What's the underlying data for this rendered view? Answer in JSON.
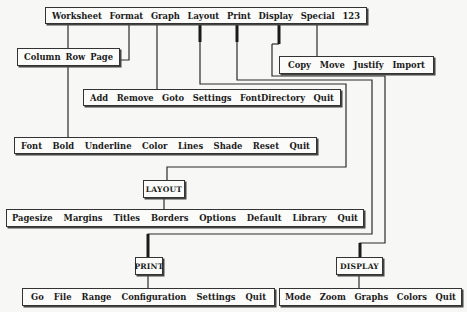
{
  "main_menu": {
    "items": [
      "Worksheet",
      "Format",
      "Graph",
      "Layout",
      "Print",
      "Display",
      "Special",
      "123"
    ]
  },
  "worksheet_menu": {
    "items": [
      "Column",
      "Row",
      "Page"
    ]
  },
  "special_menu": {
    "items": [
      "Copy",
      "Move",
      "Justify",
      "Import"
    ]
  },
  "graph_menu": {
    "items": [
      "Add",
      "Remove",
      "Goto",
      "Settings",
      "FontDirectory",
      "Quit"
    ]
  },
  "format_menu": {
    "items": [
      "Font",
      "Bold",
      "Underline",
      "Color",
      "Lines",
      "Shade",
      "Reset",
      "Quit"
    ]
  },
  "layout_title": "LAYOUT",
  "layout_menu": {
    "items": [
      "Pagesize",
      "Margins",
      "Titles",
      "Borders",
      "Options",
      "Default",
      "Library",
      "Quit"
    ]
  },
  "print_title": "PRINT",
  "print_menu": {
    "items": [
      "Go",
      "File",
      "Range",
      "Configuration",
      "Settings",
      "Quit"
    ]
  },
  "display_title": "DISPLAY",
  "display_menu": {
    "items": [
      "Mode",
      "Zoom",
      "Graphs",
      "Colors",
      "Quit"
    ]
  },
  "colors": {
    "line": "#2a2a2a",
    "background": "#f7f7f5",
    "text": "#1b1b1b"
  }
}
